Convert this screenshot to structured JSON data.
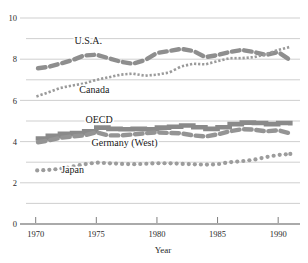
{
  "chart_data": {
    "type": "line",
    "title": "",
    "subtitle": "",
    "xlabel": "Year",
    "ylabel": "",
    "xlim": [
      1969.2,
      1991.8
    ],
    "ylim": [
      0,
      10
    ],
    "grid": true,
    "grid_step": 1,
    "legend_position": "inline-annotations",
    "ytick_labels": [
      "0",
      "2",
      "4",
      "6",
      "8",
      "10"
    ],
    "ytick_values": [
      0,
      2,
      4,
      6,
      8,
      10
    ],
    "xtick_labels": [
      "1970",
      "1975",
      "1980",
      "1985",
      "1990"
    ],
    "xtick_values": [
      1970,
      1975,
      1980,
      1985,
      1990
    ],
    "colors": {
      "usa": "#8e8e8e",
      "canada": "#9a9a9a",
      "oecd": "#8a8a8a",
      "germany": "#949494",
      "japan": "#9c9c9c",
      "grid": "#c9c9c9",
      "axis": "#6f6f6f",
      "text": "#1a1a1a"
    },
    "annotations": [
      {
        "text": "U.S.A.",
        "x": 1973.2,
        "y": 8.72
      },
      {
        "text": "Canada",
        "x": 1973.6,
        "y": 6.35
      },
      {
        "text": "OECD",
        "x": 1974.1,
        "y": 4.92
      },
      {
        "text": "Germany (West)",
        "x": 1974.6,
        "y": 3.78
      },
      {
        "text": "Japan",
        "x": 1972.1,
        "y": 2.47
      }
    ],
    "series": [
      {
        "name": "U.S.A.",
        "style": "dashed-thick",
        "x": [
          1970,
          1971,
          1972,
          1973,
          1974,
          1975,
          1976,
          1977,
          1978,
          1979,
          1980,
          1981,
          1982,
          1983,
          1984,
          1985,
          1986,
          1987,
          1988,
          1989,
          1990,
          1991
        ],
        "values": [
          7.55,
          7.62,
          7.78,
          7.95,
          8.18,
          8.22,
          8.05,
          7.88,
          7.78,
          7.95,
          8.3,
          8.4,
          8.5,
          8.4,
          8.1,
          8.2,
          8.35,
          8.45,
          8.35,
          8.2,
          8.35,
          7.95
        ]
      },
      {
        "name": "Canada",
        "style": "dotted-fine",
        "x": [
          1970,
          1971,
          1972,
          1973,
          1974,
          1975,
          1976,
          1977,
          1978,
          1979,
          1980,
          1981,
          1982,
          1983,
          1984,
          1985,
          1986,
          1987,
          1988,
          1989,
          1990,
          1991
        ],
        "values": [
          6.18,
          6.38,
          6.6,
          6.72,
          6.82,
          7.0,
          7.12,
          7.25,
          7.3,
          7.2,
          7.25,
          7.35,
          7.65,
          7.78,
          7.75,
          7.9,
          8.05,
          8.05,
          8.1,
          8.25,
          8.45,
          8.6
        ]
      },
      {
        "name": "OECD",
        "style": "solid-thick",
        "x": [
          1970,
          1971,
          1972,
          1973,
          1974,
          1975,
          1976,
          1977,
          1978,
          1979,
          1980,
          1981,
          1982,
          1983,
          1984,
          1985,
          1986,
          1987,
          1988,
          1989,
          1990,
          1991
        ],
        "values": [
          4.15,
          4.28,
          4.38,
          4.42,
          4.5,
          4.68,
          4.62,
          4.6,
          4.62,
          4.6,
          4.68,
          4.72,
          4.78,
          4.7,
          4.62,
          4.7,
          4.85,
          4.92,
          4.9,
          4.85,
          4.9,
          4.78
        ]
      },
      {
        "name": "Germany (West)",
        "style": "dashed-thick",
        "x": [
          1970,
          1971,
          1972,
          1973,
          1974,
          1975,
          1976,
          1977,
          1978,
          1979,
          1980,
          1981,
          1982,
          1983,
          1984,
          1985,
          1986,
          1987,
          1988,
          1989,
          1990,
          1991
        ],
        "values": [
          3.95,
          4.05,
          4.18,
          4.25,
          4.3,
          4.45,
          4.3,
          4.3,
          4.35,
          4.4,
          4.45,
          4.42,
          4.4,
          4.3,
          4.25,
          4.35,
          4.5,
          4.6,
          4.58,
          4.5,
          4.55,
          4.4
        ]
      },
      {
        "name": "Japan",
        "style": "dotted-round",
        "x": [
          1970,
          1971,
          1972,
          1973,
          1974,
          1975,
          1976,
          1977,
          1978,
          1979,
          1980,
          1981,
          1982,
          1983,
          1984,
          1985,
          1986,
          1987,
          1988,
          1989,
          1990,
          1991
        ],
        "values": [
          2.6,
          2.62,
          2.68,
          2.78,
          2.9,
          2.98,
          2.95,
          2.92,
          2.9,
          2.92,
          2.95,
          2.95,
          2.92,
          2.9,
          2.88,
          2.9,
          3.0,
          3.05,
          3.12,
          3.25,
          3.35,
          3.4
        ]
      }
    ]
  }
}
